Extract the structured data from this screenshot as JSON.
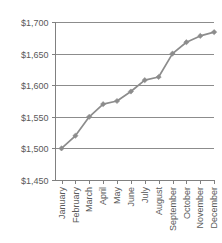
{
  "chart_data": {
    "type": "line",
    "title": "",
    "xlabel": "",
    "ylabel": "",
    "categories": [
      "January",
      "February",
      "March",
      "April",
      "May",
      "June",
      "July",
      "August",
      "September",
      "October",
      "November",
      "December"
    ],
    "values": [
      1500,
      1520,
      1550,
      1570,
      1575,
      1590,
      1608,
      1613,
      1650,
      1668,
      1678,
      1684
    ],
    "series": [
      {
        "name": "",
        "values": [
          1500,
          1520,
          1550,
          1570,
          1575,
          1590,
          1608,
          1613,
          1650,
          1668,
          1678,
          1684
        ]
      }
    ],
    "ylim": [
      1450,
      1700
    ],
    "yticks": [
      1450,
      1500,
      1550,
      1600,
      1650,
      1700
    ],
    "ytick_labels": [
      "$1,450",
      "$1,500",
      "$1,550",
      "$1,600",
      "$1,650",
      "$1,700"
    ],
    "grid": true,
    "legend": false,
    "legend_position": "none",
    "xtick_rotation": -90,
    "marker": "diamond",
    "colors": {
      "line": "#8c8c8c",
      "marker": "#8c8c8c",
      "grid": "#808080",
      "axis": "#808080",
      "text": "#595959",
      "background": "#ffffff"
    }
  }
}
